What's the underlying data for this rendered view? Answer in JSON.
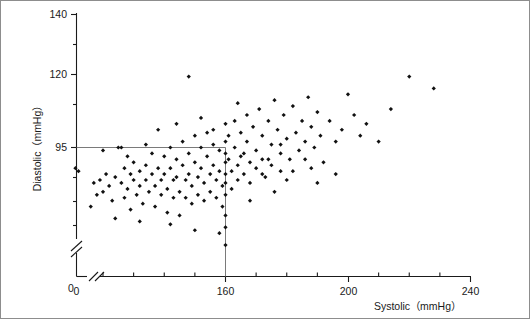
{
  "figure": {
    "kind": "scatter-plot",
    "background": "#ffffff",
    "frame_color": "#8d8d8d",
    "marker_color": "#111111",
    "axis_color": "#1a1a1a",
    "reference_line_color": "#6b6b6b"
  },
  "axes": {
    "x": {
      "title": "Systolic（mmHg）",
      "tick_labels": [
        "0",
        "160",
        "200",
        "240"
      ],
      "break_after_zero": true,
      "minor_tick_step": 10,
      "range": [
        100,
        240
      ]
    },
    "y": {
      "title": "Diastolic（mmHg）",
      "tick_labels": [
        "140",
        "120",
        "95",
        "0"
      ],
      "break_near_zero": true,
      "minor_tick_step": 5,
      "range": [
        55,
        140
      ]
    }
  },
  "reference_lines": {
    "horizontal_y": 95,
    "vertical_x": 160,
    "label_h": "95",
    "label_v": "160"
  },
  "chart_data": {
    "type": "scatter",
    "title": "",
    "xlabel": "Systolic（mmHg）",
    "ylabel": "Diastolic（mmHg）",
    "xlim": [
      100,
      240
    ],
    "ylim": [
      55,
      140
    ],
    "xticks": [
      160,
      200,
      240
    ],
    "yticks": [
      95,
      120,
      140
    ],
    "grid": false,
    "legend": null,
    "marker": "diamond",
    "marker_size": 4,
    "reference_lines": [
      {
        "orientation": "horizontal",
        "value": 95,
        "extent_x": [
          100,
          160
        ]
      },
      {
        "orientation": "vertical",
        "value": 160,
        "extent_y": [
          55,
          95
        ]
      }
    ],
    "points": [
      [
        111,
        88
      ],
      [
        117,
        83
      ],
      [
        118,
        79
      ],
      [
        119,
        84
      ],
      [
        120,
        80
      ],
      [
        121,
        86
      ],
      [
        122,
        82
      ],
      [
        123,
        77
      ],
      [
        124,
        85
      ],
      [
        125,
        95
      ],
      [
        126,
        95
      ],
      [
        126,
        83
      ],
      [
        127,
        88
      ],
      [
        127,
        78
      ],
      [
        128,
        81
      ],
      [
        129,
        86
      ],
      [
        129,
        74
      ],
      [
        130,
        90
      ],
      [
        130,
        84
      ],
      [
        131,
        79
      ],
      [
        132,
        87
      ],
      [
        132,
        82
      ],
      [
        133,
        76
      ],
      [
        134,
        89
      ],
      [
        134,
        84
      ],
      [
        135,
        80
      ],
      [
        136,
        93
      ],
      [
        136,
        86
      ],
      [
        137,
        82
      ],
      [
        137,
        75
      ],
      [
        138,
        88
      ],
      [
        139,
        84
      ],
      [
        139,
        79
      ],
      [
        140,
        92
      ],
      [
        140,
        86
      ],
      [
        141,
        81
      ],
      [
        141,
        73
      ],
      [
        142,
        95
      ],
      [
        142,
        88
      ],
      [
        143,
        84
      ],
      [
        143,
        78
      ],
      [
        144,
        91
      ],
      [
        144,
        85
      ],
      [
        145,
        80
      ],
      [
        145,
        72
      ],
      [
        146,
        97
      ],
      [
        146,
        89
      ],
      [
        147,
        84
      ],
      [
        147,
        78
      ],
      [
        148,
        93
      ],
      [
        148,
        86
      ],
      [
        149,
        82
      ],
      [
        149,
        76
      ],
      [
        150,
        99
      ],
      [
        150,
        90
      ],
      [
        151,
        85
      ],
      [
        151,
        79
      ],
      [
        152,
        95
      ],
      [
        152,
        88
      ],
      [
        153,
        83
      ],
      [
        153,
        77
      ],
      [
        154,
        100
      ],
      [
        154,
        92
      ],
      [
        155,
        86
      ],
      [
        155,
        80
      ],
      [
        156,
        96
      ],
      [
        156,
        89
      ],
      [
        157,
        84
      ],
      [
        157,
        78
      ],
      [
        158,
        94
      ],
      [
        158,
        87
      ],
      [
        159,
        82
      ],
      [
        159,
        75
      ],
      [
        160,
        103
      ],
      [
        160,
        97
      ],
      [
        160,
        93
      ],
      [
        160,
        90
      ],
      [
        160,
        86
      ],
      [
        160,
        83
      ],
      [
        160,
        79
      ],
      [
        160,
        72
      ],
      [
        160,
        68
      ],
      [
        161,
        99
      ],
      [
        161,
        91
      ],
      [
        162,
        87
      ],
      [
        162,
        81
      ],
      [
        163,
        104
      ],
      [
        163,
        95
      ],
      [
        164,
        89
      ],
      [
        164,
        84
      ],
      [
        165,
        100
      ],
      [
        165,
        92
      ],
      [
        166,
        86
      ],
      [
        167,
        106
      ],
      [
        167,
        97
      ],
      [
        168,
        90
      ],
      [
        168,
        83
      ],
      [
        169,
        102
      ],
      [
        170,
        94
      ],
      [
        170,
        88
      ],
      [
        171,
        108
      ],
      [
        172,
        99
      ],
      [
        172,
        91
      ],
      [
        173,
        85
      ],
      [
        174,
        104
      ],
      [
        175,
        96
      ],
      [
        175,
        89
      ],
      [
        176,
        111
      ],
      [
        177,
        101
      ],
      [
        178,
        93
      ],
      [
        178,
        87
      ],
      [
        179,
        106
      ],
      [
        180,
        98
      ],
      [
        181,
        91
      ],
      [
        182,
        109
      ],
      [
        183,
        100
      ],
      [
        184,
        94
      ],
      [
        185,
        104
      ],
      [
        186,
        97
      ],
      [
        187,
        112
      ],
      [
        188,
        102
      ],
      [
        189,
        95
      ],
      [
        190,
        107
      ],
      [
        191,
        99
      ],
      [
        192,
        90
      ],
      [
        194,
        104
      ],
      [
        196,
        97
      ],
      [
        198,
        101
      ],
      [
        200,
        113
      ],
      [
        202,
        106
      ],
      [
        204,
        99
      ],
      [
        206,
        103
      ],
      [
        210,
        97
      ],
      [
        214,
        108
      ],
      [
        220,
        119
      ],
      [
        228,
        115
      ],
      [
        148,
        119
      ],
      [
        138,
        101
      ],
      [
        134,
        96
      ],
      [
        128,
        92
      ],
      [
        120,
        94
      ],
      [
        112,
        87
      ],
      [
        116,
        75
      ],
      [
        124,
        71
      ],
      [
        132,
        70
      ],
      [
        142,
        69
      ],
      [
        150,
        67
      ],
      [
        158,
        66
      ],
      [
        144,
        103
      ],
      [
        152,
        105
      ],
      [
        156,
        101
      ],
      [
        164,
        110
      ],
      [
        172,
        86
      ],
      [
        180,
        84
      ],
      [
        188,
        88
      ],
      [
        196,
        86
      ],
      [
        176,
        80
      ],
      [
        168,
        77
      ],
      [
        160,
        62
      ],
      [
        166,
        93
      ],
      [
        174,
        91
      ],
      [
        182,
        87
      ],
      [
        190,
        83
      ],
      [
        186,
        91
      ],
      [
        178,
        96
      ]
    ]
  }
}
